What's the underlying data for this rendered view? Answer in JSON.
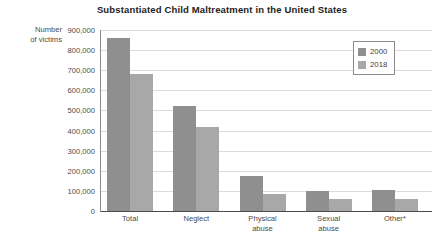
{
  "chart_data": {
    "type": "bar",
    "title": "Substantiated Child Maltreatment in the United States",
    "xlabel": "",
    "ylabel": "Number of victims",
    "ylim": [
      0,
      900000
    ],
    "grid": true,
    "legend_position": "top-right",
    "categories": [
      "Total",
      "Neglect",
      "Physical abuse",
      "Sexual abuse",
      "Other*"
    ],
    "ytick_labels": [
      "900,000",
      "800,000",
      "700,000",
      "600,000",
      "500,000",
      "400,000",
      "300,000",
      "200,000",
      "100,000",
      "0"
    ],
    "ytick_values": [
      900000,
      800000,
      700000,
      600000,
      500000,
      400000,
      300000,
      200000,
      100000,
      0
    ],
    "series": [
      {
        "name": "2000",
        "color": "#8f8f8f",
        "values": [
          860000,
          520000,
          175000,
          98000,
          105000
        ]
      },
      {
        "name": "2018",
        "color": "#a8a8a8",
        "values": [
          680000,
          420000,
          85000,
          60000,
          58000
        ]
      }
    ]
  },
  "legend": {
    "entries": [
      {
        "label": "2000",
        "color": "#8f8f8f"
      },
      {
        "label": "2018",
        "color": "#a8a8a8"
      }
    ]
  },
  "axis": {
    "y_title_line1": "Number",
    "y_title_line2": "of victims"
  },
  "x_labels": [
    {
      "line1": "Total",
      "line2": ""
    },
    {
      "line1": "Neglect",
      "line2": ""
    },
    {
      "line1": "Physical",
      "line2": "abuse"
    },
    {
      "line1": "Sexual",
      "line2": "abuse"
    },
    {
      "line1": "Other*",
      "line2": ""
    }
  ]
}
